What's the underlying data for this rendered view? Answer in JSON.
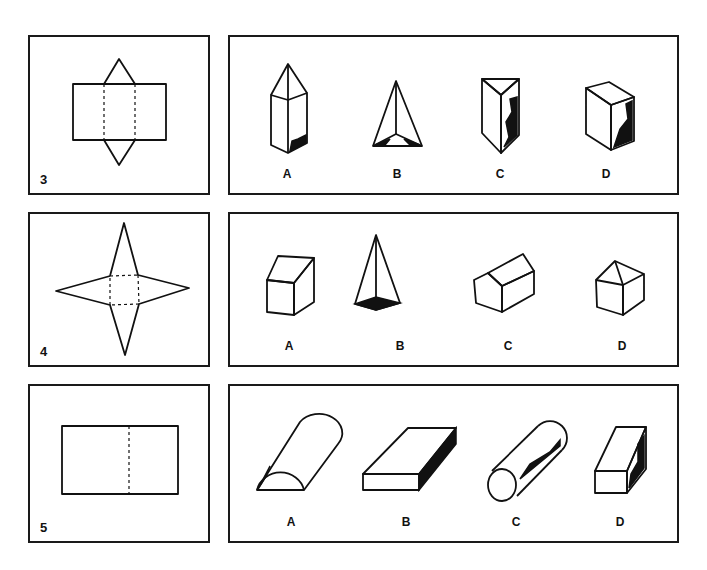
{
  "problems": [
    {
      "number": "3",
      "net": "rectangle with two triangles (triangular prism net)",
      "options": [
        {
          "label": "A",
          "shape": "hexagonal-prism-with-pyramid-top"
        },
        {
          "label": "B",
          "shape": "triangular-pyramid"
        },
        {
          "label": "C",
          "shape": "triangular-prism"
        },
        {
          "label": "D",
          "shape": "rectangular-box"
        }
      ]
    },
    {
      "number": "4",
      "net": "square with four triangles (square pyramid net)",
      "options": [
        {
          "label": "A",
          "shape": "slanted-top-box"
        },
        {
          "label": "B",
          "shape": "square-pyramid"
        },
        {
          "label": "C",
          "shape": "house-prism"
        },
        {
          "label": "D",
          "shape": "cube-with-pyramid-roof"
        }
      ]
    },
    {
      "number": "5",
      "net": "rectangle with center fold line",
      "options": [
        {
          "label": "A",
          "shape": "half-cylinder"
        },
        {
          "label": "B",
          "shape": "flat-slab"
        },
        {
          "label": "C",
          "shape": "cylinder"
        },
        {
          "label": "D",
          "shape": "rectangular-bar"
        }
      ]
    }
  ]
}
